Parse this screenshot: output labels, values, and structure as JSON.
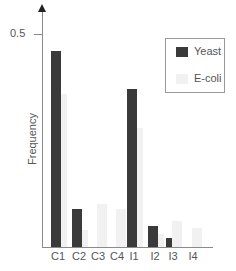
{
  "chart_data": {
    "type": "bar",
    "title": "",
    "xlabel": "",
    "ylabel": "Frequency",
    "ylim": [
      0,
      0.55
    ],
    "yticks": [
      0.5
    ],
    "ytick_labels": [
      "0.5"
    ],
    "grid": false,
    "legend_position": "upper right",
    "categories": [
      "C1",
      "C2",
      "C3",
      "C4",
      "I1",
      "I2",
      "I3",
      "I4"
    ],
    "series": [
      {
        "name": "Yeast",
        "color": "#3a3a3a",
        "values": [
          0.46,
          0.09,
          0.0,
          0.0,
          0.37,
          0.05,
          0.02,
          0.0
        ]
      },
      {
        "name": "E-coli",
        "color": "#f1f1f1",
        "values": [
          0.36,
          0.04,
          0.1,
          0.09,
          0.28,
          0.03,
          0.06,
          0.045
        ]
      }
    ]
  },
  "axis": {
    "ylabel": "Frequency",
    "tick_label": "0.5"
  },
  "legend": {
    "items": [
      {
        "label": "Yeast",
        "color": "#3a3a3a"
      },
      {
        "label": "E-coli",
        "color": "#f1f1f1"
      }
    ]
  }
}
